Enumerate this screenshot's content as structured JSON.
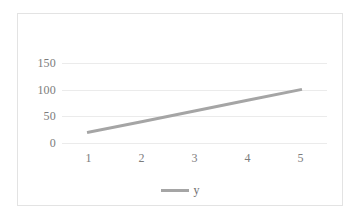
{
  "chart_data": {
    "type": "line",
    "title": "",
    "xlabel": "",
    "ylabel": "",
    "x": [
      1,
      2,
      3,
      4,
      5
    ],
    "categories": [
      "1",
      "2",
      "3",
      "4",
      "5"
    ],
    "series": [
      {
        "name": "y",
        "values": [
          20,
          40,
          60,
          80,
          100
        ],
        "color": "#a5a5a5"
      }
    ],
    "ylim": [
      0,
      150
    ],
    "yticks": [
      0,
      50,
      100,
      150
    ],
    "ytick_labels": [
      "0",
      "50",
      "100",
      "150"
    ],
    "xtick_labels": [
      "1",
      "2",
      "3",
      "4",
      "5"
    ],
    "grid": true,
    "grid_axis": "y",
    "legend": {
      "position": "bottom",
      "entries": [
        {
          "label": "y",
          "color": "#a5a5a5",
          "marker": "line"
        }
      ]
    },
    "colors": {
      "series": "#a5a5a5",
      "gridline": "#ebebeb",
      "border": "#e3e3e3",
      "tick_text": "#7c7c7c",
      "background": "#ffffff"
    }
  }
}
